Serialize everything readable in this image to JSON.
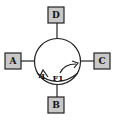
{
  "diagram": {
    "boxes": {
      "top": {
        "label": "D"
      },
      "left": {
        "label": "A"
      },
      "right": {
        "label": "C"
      },
      "bottom": {
        "label": "B"
      }
    },
    "circle": {
      "inner_labels": {
        "left_marker": "1",
        "center": "F1"
      }
    },
    "colors": {
      "box_fill": "#c8c8c8",
      "stroke": "#222222",
      "background": "#ffffff"
    }
  }
}
